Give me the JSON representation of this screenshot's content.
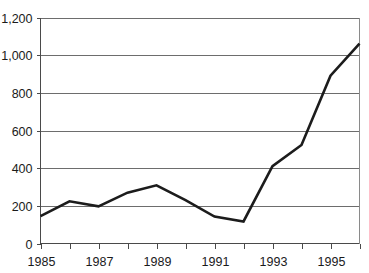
{
  "chart_data": {
    "type": "line",
    "title": "",
    "subtitle": "",
    "xlabel": "",
    "ylabel": "",
    "x": [
      1985,
      1986,
      1987,
      1988,
      1989,
      1990,
      1991,
      1992,
      1993,
      1994,
      1995,
      1996
    ],
    "series": [
      {
        "name": "",
        "values": [
          145,
          224,
          197,
          270,
          309,
          230,
          143,
          117,
          411,
          523,
          891,
          1061
        ]
      }
    ],
    "xlim": [
      1985,
      1996
    ],
    "ylim": [
      0,
      1200
    ],
    "y_ticks": [
      0,
      200,
      400,
      600,
      800,
      1000,
      1200
    ],
    "y_tick_labels": [
      "0",
      "200",
      "400",
      "600",
      "800",
      "1,000",
      "1,200"
    ],
    "x_ticks": [
      1985,
      1986,
      1987,
      1988,
      1989,
      1990,
      1991,
      1992,
      1993,
      1994,
      1995,
      1996
    ],
    "x_tick_labels": [
      "1985",
      "",
      "1987",
      "",
      "1989",
      "",
      "1991",
      "",
      "1993",
      "",
      "1995",
      ""
    ],
    "x_labeled_ticks": [
      "1985",
      "1987",
      "1989",
      "1991",
      "1993",
      "1995"
    ],
    "grid": true,
    "grid_axis": "y",
    "legend": false,
    "legend_position": "none",
    "annotations": [],
    "colors": {
      "line": "#1c1c1c",
      "grid": "#6d6d6d",
      "axis": "#4a4a4a",
      "text": "#1a1a1a",
      "background": "#ffffff"
    }
  }
}
